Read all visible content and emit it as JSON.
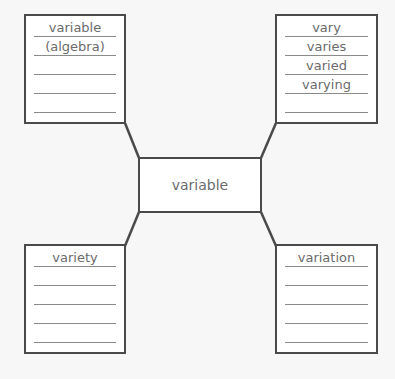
{
  "diagram": {
    "type": "word-map",
    "center": {
      "label": "variable"
    },
    "boxes": {
      "top_left": {
        "lines": [
          "variable",
          "(algebra)",
          "",
          "",
          ""
        ]
      },
      "top_right": {
        "lines": [
          "vary",
          "varies",
          "varied",
          "varying",
          ""
        ]
      },
      "bottom_left": {
        "lines": [
          "variety",
          "",
          "",
          "",
          ""
        ]
      },
      "bottom_right": {
        "lines": [
          "variation",
          "",
          "",
          "",
          ""
        ]
      }
    },
    "colors": {
      "border": "#4a4a4a",
      "rule": "#8a8a8a",
      "text": "#6b6b6b",
      "background": "#f7f7f7"
    }
  }
}
